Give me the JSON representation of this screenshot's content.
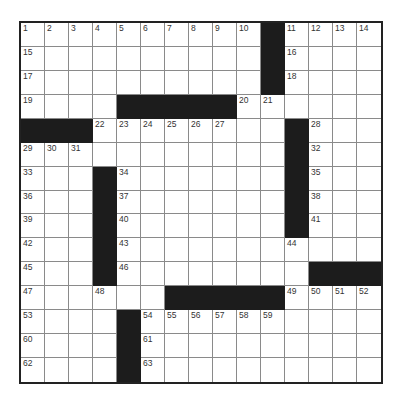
{
  "puzzle": {
    "rows": 15,
    "cols": 15,
    "colors": {
      "block": "#1c1c1c",
      "cell": "#ffffff",
      "border": "#222222",
      "gridline": "#8a8a8a",
      "number": "#333333"
    },
    "blocks": [
      [
        0,
        10
      ],
      [
        1,
        10
      ],
      [
        2,
        10
      ],
      [
        3,
        4
      ],
      [
        3,
        5
      ],
      [
        3,
        6
      ],
      [
        3,
        7
      ],
      [
        3,
        8
      ],
      [
        4,
        0
      ],
      [
        4,
        1
      ],
      [
        4,
        2
      ],
      [
        4,
        11
      ],
      [
        5,
        11
      ],
      [
        6,
        3
      ],
      [
        6,
        11
      ],
      [
        7,
        3
      ],
      [
        7,
        11
      ],
      [
        8,
        3
      ],
      [
        8,
        11
      ],
      [
        9,
        3
      ],
      [
        10,
        3
      ],
      [
        10,
        12
      ],
      [
        10,
        13
      ],
      [
        10,
        14
      ],
      [
        11,
        6
      ],
      [
        11,
        7
      ],
      [
        11,
        8
      ],
      [
        11,
        9
      ],
      [
        11,
        10
      ],
      [
        12,
        4
      ],
      [
        13,
        4
      ],
      [
        14,
        4
      ]
    ],
    "numbers": [
      {
        "r": 0,
        "c": 0,
        "n": "1"
      },
      {
        "r": 0,
        "c": 1,
        "n": "2"
      },
      {
        "r": 0,
        "c": 2,
        "n": "3"
      },
      {
        "r": 0,
        "c": 3,
        "n": "4"
      },
      {
        "r": 0,
        "c": 4,
        "n": "5"
      },
      {
        "r": 0,
        "c": 5,
        "n": "6"
      },
      {
        "r": 0,
        "c": 6,
        "n": "7"
      },
      {
        "r": 0,
        "c": 7,
        "n": "8"
      },
      {
        "r": 0,
        "c": 8,
        "n": "9"
      },
      {
        "r": 0,
        "c": 9,
        "n": "10"
      },
      {
        "r": 0,
        "c": 11,
        "n": "11"
      },
      {
        "r": 0,
        "c": 12,
        "n": "12"
      },
      {
        "r": 0,
        "c": 13,
        "n": "13"
      },
      {
        "r": 0,
        "c": 14,
        "n": "14"
      },
      {
        "r": 1,
        "c": 0,
        "n": "15"
      },
      {
        "r": 1,
        "c": 11,
        "n": "16"
      },
      {
        "r": 2,
        "c": 0,
        "n": "17"
      },
      {
        "r": 2,
        "c": 11,
        "n": "18"
      },
      {
        "r": 3,
        "c": 0,
        "n": "19"
      },
      {
        "r": 3,
        "c": 9,
        "n": "20"
      },
      {
        "r": 3,
        "c": 10,
        "n": "21"
      },
      {
        "r": 4,
        "c": 3,
        "n": "22"
      },
      {
        "r": 4,
        "c": 4,
        "n": "23"
      },
      {
        "r": 4,
        "c": 5,
        "n": "24"
      },
      {
        "r": 4,
        "c": 6,
        "n": "25"
      },
      {
        "r": 4,
        "c": 7,
        "n": "26"
      },
      {
        "r": 4,
        "c": 8,
        "n": "27"
      },
      {
        "r": 4,
        "c": 12,
        "n": "28"
      },
      {
        "r": 5,
        "c": 0,
        "n": "29"
      },
      {
        "r": 5,
        "c": 1,
        "n": "30"
      },
      {
        "r": 5,
        "c": 2,
        "n": "31"
      },
      {
        "r": 5,
        "c": 12,
        "n": "32"
      },
      {
        "r": 6,
        "c": 0,
        "n": "33"
      },
      {
        "r": 6,
        "c": 4,
        "n": "34"
      },
      {
        "r": 6,
        "c": 12,
        "n": "35"
      },
      {
        "r": 7,
        "c": 0,
        "n": "36"
      },
      {
        "r": 7,
        "c": 4,
        "n": "37"
      },
      {
        "r": 7,
        "c": 12,
        "n": "38"
      },
      {
        "r": 8,
        "c": 0,
        "n": "39"
      },
      {
        "r": 8,
        "c": 4,
        "n": "40"
      },
      {
        "r": 8,
        "c": 12,
        "n": "41"
      },
      {
        "r": 9,
        "c": 0,
        "n": "42"
      },
      {
        "r": 9,
        "c": 4,
        "n": "43"
      },
      {
        "r": 9,
        "c": 11,
        "n": "44"
      },
      {
        "r": 10,
        "c": 0,
        "n": "45"
      },
      {
        "r": 10,
        "c": 4,
        "n": "46"
      },
      {
        "r": 11,
        "c": 0,
        "n": "47"
      },
      {
        "r": 11,
        "c": 3,
        "n": "48"
      },
      {
        "r": 11,
        "c": 11,
        "n": "49"
      },
      {
        "r": 11,
        "c": 12,
        "n": "50"
      },
      {
        "r": 11,
        "c": 13,
        "n": "51"
      },
      {
        "r": 11,
        "c": 14,
        "n": "52"
      },
      {
        "r": 12,
        "c": 0,
        "n": "53"
      },
      {
        "r": 12,
        "c": 5,
        "n": "54"
      },
      {
        "r": 12,
        "c": 6,
        "n": "55"
      },
      {
        "r": 12,
        "c": 7,
        "n": "56"
      },
      {
        "r": 12,
        "c": 8,
        "n": "57"
      },
      {
        "r": 12,
        "c": 9,
        "n": "58"
      },
      {
        "r": 12,
        "c": 10,
        "n": "59"
      },
      {
        "r": 13,
        "c": 0,
        "n": "60"
      },
      {
        "r": 13,
        "c": 5,
        "n": "61"
      },
      {
        "r": 14,
        "c": 0,
        "n": "62"
      },
      {
        "r": 14,
        "c": 5,
        "n": "63"
      }
    ]
  }
}
